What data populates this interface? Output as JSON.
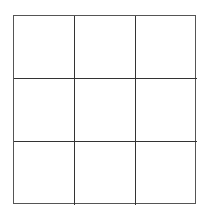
{
  "game": {
    "type": "tic-tac-toe",
    "rows": 3,
    "cols": 3,
    "line_color": "#333333",
    "board": [
      [
        "",
        "",
        ""
      ],
      [
        "",
        "",
        ""
      ],
      [
        "",
        "",
        ""
      ]
    ]
  }
}
